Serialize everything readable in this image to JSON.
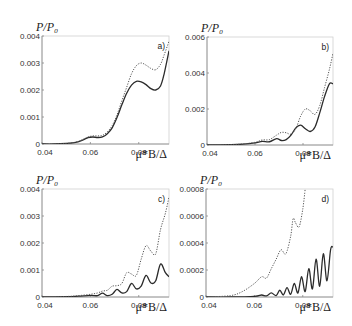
{
  "chart_data": [
    {
      "type": "line",
      "panel_label": "a)",
      "ylabel": "P/P₀",
      "xlabel": "μ*B/Δ",
      "xlim": [
        0.04,
        0.0925
      ],
      "ylim": [
        0,
        0.004
      ],
      "xticks": [
        0.04,
        0.06,
        0.08
      ],
      "xtick_labels": [
        "0.04",
        "0.06",
        "0.08"
      ],
      "yticks": [
        0,
        0.001,
        0.002,
        0.003,
        0.004
      ],
      "ytick_labels": [
        "0",
        "0.001",
        "0.002",
        "0.003",
        "0.004"
      ],
      "series": [
        {
          "name": "solid",
          "style": "solid",
          "x": [
            0.04,
            0.045,
            0.05,
            0.054,
            0.057,
            0.059,
            0.061,
            0.063,
            0.065,
            0.067,
            0.069,
            0.071,
            0.073,
            0.075,
            0.077,
            0.079,
            0.081,
            0.083,
            0.085,
            0.087,
            0.089,
            0.0905,
            0.0925
          ],
          "y": [
            0.0,
            0.0,
            2e-05,
            6e-05,
            0.00015,
            0.00024,
            0.00026,
            0.00024,
            0.00026,
            0.00038,
            0.0006,
            0.00098,
            0.00145,
            0.00188,
            0.00218,
            0.00232,
            0.0023,
            0.0022,
            0.00205,
            0.002,
            0.00215,
            0.0026,
            0.00345
          ]
        },
        {
          "name": "dotted",
          "style": "dotted",
          "x": [
            0.04,
            0.045,
            0.05,
            0.054,
            0.057,
            0.059,
            0.061,
            0.063,
            0.065,
            0.067,
            0.069,
            0.071,
            0.073,
            0.075,
            0.077,
            0.079,
            0.081,
            0.083,
            0.085,
            0.087,
            0.089,
            0.0905,
            0.0925
          ],
          "y": [
            0.0,
            0.0,
            2e-05,
            7e-05,
            0.00017,
            0.00026,
            0.0003,
            0.0003,
            0.00032,
            0.00045,
            0.00068,
            0.00108,
            0.0016,
            0.0021,
            0.0026,
            0.0029,
            0.003,
            0.00292,
            0.0028,
            0.00275,
            0.00295,
            0.0033,
            0.0038
          ]
        }
      ]
    },
    {
      "type": "line",
      "panel_label": "b)",
      "ylabel": "P/P₀",
      "xlabel": "μ*B/Δ",
      "xlim": [
        0.04,
        0.0925
      ],
      "ylim": [
        0,
        0.006
      ],
      "xticks": [
        0.04,
        0.06,
        0.08
      ],
      "xtick_labels": [
        "0.04",
        "0.06",
        "0.08"
      ],
      "yticks": [
        0,
        0.002,
        0.004,
        0.006
      ],
      "ytick_labels": [
        "0",
        "0.002",
        "0.004",
        "0.006"
      ],
      "series": [
        {
          "name": "solid",
          "style": "solid",
          "x": [
            0.04,
            0.05,
            0.055,
            0.06,
            0.063,
            0.066,
            0.069,
            0.071,
            0.073,
            0.075,
            0.077,
            0.079,
            0.081,
            0.083,
            0.085,
            0.087,
            0.089,
            0.091,
            0.0925
          ],
          "y": [
            0.0,
            2e-05,
            5e-05,
            0.00012,
            0.0002,
            0.00018,
            0.00035,
            0.00025,
            0.0003,
            0.00055,
            0.00095,
            0.0011,
            0.0009,
            0.00075,
            0.001,
            0.0018,
            0.0027,
            0.0034,
            0.0034
          ]
        },
        {
          "name": "dotted",
          "style": "dotted",
          "x": [
            0.04,
            0.05,
            0.055,
            0.06,
            0.063,
            0.066,
            0.069,
            0.071,
            0.073,
            0.075,
            0.077,
            0.079,
            0.081,
            0.083,
            0.085,
            0.087,
            0.089,
            0.091,
            0.0925
          ],
          "y": [
            0.0,
            2e-05,
            6e-05,
            0.00015,
            0.00028,
            0.0003,
            0.00055,
            0.0007,
            0.00068,
            0.0006,
            0.0009,
            0.0016,
            0.002,
            0.0019,
            0.0017,
            0.0022,
            0.0032,
            0.0042,
            0.0051
          ]
        }
      ]
    },
    {
      "type": "line",
      "panel_label": "c)",
      "ylabel": "P/P₀",
      "xlabel": "μ*B/Δ",
      "xlim": [
        0.04,
        0.0925
      ],
      "ylim": [
        0,
        0.004
      ],
      "xticks": [
        0.04,
        0.06,
        0.08
      ],
      "xtick_labels": [
        "0.04",
        "0.06",
        "0.08"
      ],
      "yticks": [
        0,
        0.001,
        0.002,
        0.003,
        0.004
      ],
      "ytick_labels": [
        "0",
        "0.001",
        "0.002",
        "0.003",
        "0.004"
      ],
      "series": [
        {
          "name": "solid",
          "style": "solid",
          "x": [
            0.04,
            0.05,
            0.055,
            0.06,
            0.063,
            0.065,
            0.067,
            0.069,
            0.071,
            0.073,
            0.075,
            0.077,
            0.079,
            0.081,
            0.083,
            0.085,
            0.087,
            0.089,
            0.091,
            0.0925
          ],
          "y": [
            0.0,
            1e-05,
            3e-05,
            6e-05,
            5e-05,
            0.00014,
            5e-05,
            0.0001,
            0.00028,
            0.00015,
            0.0002,
            0.0005,
            0.0003,
            0.0004,
            0.0008,
            0.00052,
            0.0006,
            0.00122,
            0.0009,
            0.00075
          ]
        },
        {
          "name": "dotted",
          "style": "dotted",
          "x": [
            0.04,
            0.05,
            0.055,
            0.06,
            0.063,
            0.065,
            0.067,
            0.069,
            0.071,
            0.073,
            0.075,
            0.077,
            0.079,
            0.081,
            0.083,
            0.085,
            0.087,
            0.089,
            0.091,
            0.0925
          ],
          "y": [
            0.0,
            2e-05,
            5e-05,
            0.0001,
            0.00015,
            0.00022,
            0.00025,
            0.0004,
            0.00042,
            0.0005,
            0.0009,
            0.00085,
            0.0008,
            0.0014,
            0.0019,
            0.0017,
            0.0016,
            0.0025,
            0.0031,
            0.0037
          ]
        }
      ]
    },
    {
      "type": "line",
      "panel_label": "d)",
      "ylabel": "P/P₀",
      "xlabel": "μ*B/Δ",
      "xlim": [
        0.04,
        0.0925
      ],
      "ylim": [
        0,
        0.0008
      ],
      "xticks": [
        0.04,
        0.06,
        0.08
      ],
      "xtick_labels": [
        "0.04",
        "0.06",
        "0.08"
      ],
      "yticks": [
        0,
        0.0002,
        0.0004,
        0.0006,
        0.0008
      ],
      "ytick_labels": [
        "0",
        "0.0002",
        "0.0004",
        "0.0006",
        "0.0008"
      ],
      "series": [
        {
          "name": "solid",
          "style": "solid",
          "x": [
            0.04,
            0.05,
            0.06,
            0.063,
            0.065,
            0.067,
            0.069,
            0.0705,
            0.072,
            0.0735,
            0.075,
            0.0765,
            0.078,
            0.0795,
            0.081,
            0.0825,
            0.084,
            0.0855,
            0.087,
            0.0885,
            0.09,
            0.0915,
            0.0925
          ],
          "y": [
            0.0,
            0.0,
            5e-06,
            1.5e-05,
            8e-06,
            3e-05,
            1e-05,
            5e-05,
            1.5e-05,
            7e-05,
            2e-05,
            0.0001,
            3e-05,
            0.00015,
            4e-05,
            0.00021,
            6e-05,
            0.00028,
            8e-05,
            0.00032,
            0.00012,
            0.00035,
            0.00037
          ]
        },
        {
          "name": "dotted",
          "style": "dotted",
          "x": [
            0.04,
            0.05,
            0.055,
            0.06,
            0.063,
            0.065,
            0.067,
            0.069,
            0.071,
            0.073,
            0.075,
            0.076,
            0.077,
            0.0785,
            0.08,
            0.081
          ],
          "y": [
            0.0,
            1e-05,
            4e-05,
            0.0001,
            0.00015,
            0.00014,
            0.00021,
            0.00028,
            0.00035,
            0.00032,
            0.00045,
            0.00058,
            0.00055,
            0.00052,
            0.00065,
            0.0008
          ]
        }
      ]
    }
  ]
}
